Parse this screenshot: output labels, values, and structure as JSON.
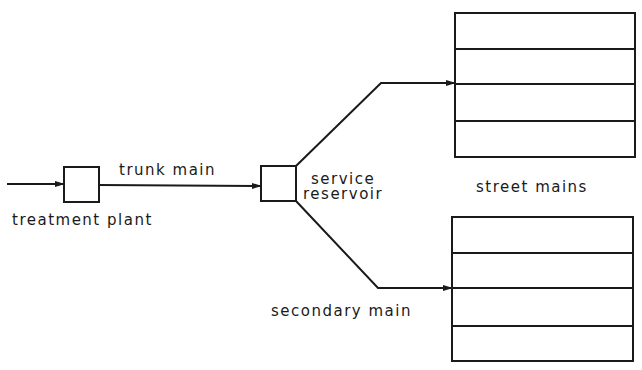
{
  "diagram": {
    "nodes": [
      {
        "id": "treatment_plant",
        "label": "treatment plant"
      },
      {
        "id": "service_reservoir",
        "label_line1": "service",
        "label_line2": "reservoir"
      },
      {
        "id": "street_mains_upper",
        "label": "street mains",
        "rows": 4
      },
      {
        "id": "street_mains_lower",
        "rows": 4
      }
    ],
    "edges": [
      {
        "from": "source",
        "to": "treatment_plant",
        "label": ""
      },
      {
        "from": "treatment_plant",
        "to": "service_reservoir",
        "label": "trunk main"
      },
      {
        "from": "service_reservoir",
        "to": "street_mains_upper",
        "label": ""
      },
      {
        "from": "service_reservoir",
        "to": "street_mains_lower",
        "label": "secondary main"
      }
    ],
    "colors": {
      "stroke": "#1a1a1a",
      "background": "#ffffff"
    }
  },
  "labels": {
    "trunk_main": "trunk main",
    "treatment_plant": "treatment plant",
    "service": "service",
    "reservoir": "reservoir",
    "street_mains": "street mains",
    "secondary_main": "secondary main"
  }
}
